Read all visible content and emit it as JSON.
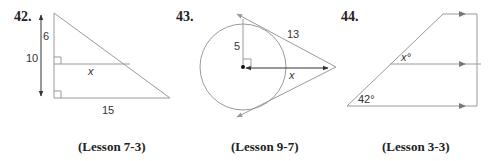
{
  "problems": [
    {
      "number": "42.",
      "lesson": "(Lesson 7-3)",
      "labels": {
        "top_segment": "6",
        "total_height": "10",
        "unknown": "x",
        "base": "15"
      }
    },
    {
      "number": "43.",
      "lesson": "(Lesson 9-7)",
      "labels": {
        "radius": "5",
        "tangent": "13",
        "unknown": "x"
      }
    },
    {
      "number": "44.",
      "lesson": "(Lesson 3-3)",
      "labels": {
        "unknown_angle": "x°",
        "given_angle": "42°"
      }
    }
  ]
}
